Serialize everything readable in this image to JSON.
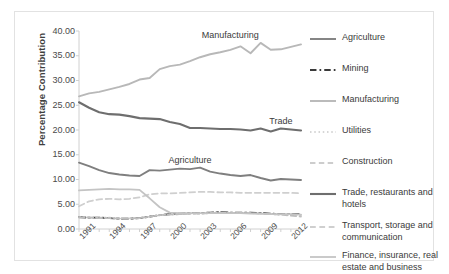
{
  "chart_data": {
    "type": "line",
    "title": "",
    "xlabel": "",
    "ylabel": "Percentage Contribution",
    "ylim": [
      0,
      40
    ],
    "yticks": [
      "0.00",
      "5.00",
      "10.00",
      "15.00",
      "20.00",
      "25.00",
      "30.00",
      "35.00",
      "40.00"
    ],
    "ytick_values": [
      0,
      5,
      10,
      15,
      20,
      25,
      30,
      35,
      40
    ],
    "grid": false,
    "legend_position": "right",
    "x": [
      1991,
      1992,
      1993,
      1994,
      1995,
      1996,
      1997,
      1998,
      1999,
      2000,
      2001,
      2002,
      2003,
      2004,
      2005,
      2006,
      2007,
      2008,
      2009,
      2010,
      2011,
      2012,
      2013
    ],
    "xticks": [
      "1991",
      "1994",
      "1997",
      "2000",
      "2003",
      "2006",
      "2009",
      "2012"
    ],
    "xtick_values": [
      1991,
      1994,
      1997,
      2000,
      2003,
      2006,
      2009,
      2012
    ],
    "annotations": [
      {
        "text": "Manufacturing",
        "x": 2006,
        "y": 39.0
      },
      {
        "text": "Agriculture",
        "x": 2002,
        "y": 13.8
      },
      {
        "text": "Trade",
        "x": 2011,
        "y": 21.6
      }
    ],
    "series": [
      {
        "name": "Agriculture",
        "color": "#7f7f7f",
        "style": "solid",
        "width": 1.9,
        "values": [
          13.4,
          12.7,
          11.9,
          11.3,
          11.0,
          10.8,
          10.7,
          11.9,
          11.8,
          12.0,
          12.2,
          12.1,
          12.4,
          11.6,
          11.2,
          10.9,
          10.7,
          10.9,
          10.3,
          9.8,
          10.1,
          10.0,
          9.9
        ]
      },
      {
        "name": "Mining",
        "color": "#3a3a3a",
        "style": "dashdot",
        "width": 1.9,
        "values": [
          2.4,
          2.3,
          2.3,
          2.2,
          2.1,
          2.1,
          2.2,
          2.5,
          2.8,
          3.0,
          3.1,
          3.2,
          3.2,
          3.3,
          3.4,
          3.3,
          3.3,
          3.3,
          3.2,
          3.1,
          3.0,
          3.0,
          3.0
        ]
      },
      {
        "name": "Manufacturing",
        "color": "#b8b8b8",
        "style": "solid",
        "width": 1.9,
        "values": [
          26.8,
          27.4,
          27.7,
          28.2,
          28.7,
          29.3,
          30.2,
          30.5,
          32.3,
          32.9,
          33.2,
          33.9,
          34.7,
          35.3,
          35.7,
          36.2,
          36.9,
          35.5,
          37.6,
          36.2,
          36.3,
          36.8,
          37.3
        ]
      },
      {
        "name": "Utilities",
        "color": "#c9c9c9",
        "style": "dotted",
        "width": 1.7,
        "values": [
          2.4,
          2.4,
          2.3,
          2.3,
          2.2,
          2.2,
          2.2,
          2.5,
          2.8,
          2.9,
          3.0,
          3.1,
          3.1,
          3.2,
          3.2,
          3.2,
          3.2,
          3.2,
          3.1,
          3.0,
          2.9,
          2.9,
          2.8
        ]
      },
      {
        "name": "Construction",
        "color": "#bdbdbd",
        "style": "dashed",
        "width": 1.7,
        "values": [
          2.3,
          2.3,
          2.2,
          2.2,
          2.1,
          2.1,
          2.2,
          2.5,
          2.8,
          2.9,
          3.0,
          3.1,
          3.1,
          3.2,
          3.3,
          3.2,
          3.2,
          3.2,
          3.1,
          3.0,
          2.9,
          2.7,
          2.5
        ]
      },
      {
        "name": "Trade, restaurants and hotels",
        "color": "#6e6e6e",
        "style": "solid",
        "width": 2.1,
        "values": [
          25.6,
          24.5,
          23.6,
          23.2,
          23.1,
          22.8,
          22.4,
          22.3,
          22.2,
          21.6,
          21.2,
          20.4,
          20.4,
          20.3,
          20.2,
          20.2,
          20.1,
          19.9,
          20.3,
          19.7,
          20.3,
          20.1,
          19.9
        ]
      },
      {
        "name": "Transport, storage and communication",
        "color": "#cfcfcf",
        "style": "dashed",
        "width": 1.8,
        "values": [
          4.6,
          5.6,
          6.0,
          6.1,
          6.0,
          6.1,
          6.4,
          7.0,
          7.2,
          7.2,
          7.3,
          7.4,
          7.5,
          7.5,
          7.4,
          7.4,
          7.3,
          7.3,
          7.3,
          7.3,
          7.3,
          7.3,
          7.2
        ]
      },
      {
        "name": "Finance, insurance, real estate and business services",
        "color": "#c4c4c4",
        "style": "solid",
        "width": 1.8,
        "values": [
          7.8,
          7.9,
          8.0,
          8.1,
          8.0,
          8.0,
          7.9,
          6.2,
          4.4,
          3.3,
          3.2,
          3.2,
          3.2,
          3.2,
          3.2,
          3.2,
          3.2,
          3.1,
          3.1,
          3.0,
          3.0,
          3.0,
          2.9
        ]
      }
    ]
  },
  "legend": {
    "items": [
      {
        "label": "Agriculture"
      },
      {
        "label": "Mining"
      },
      {
        "label": "Manufacturing"
      },
      {
        "label": "Utilities"
      },
      {
        "label": "Construction"
      },
      {
        "label": "Trade, restaurants and hotels"
      },
      {
        "label": "Transport, storage and communication"
      },
      {
        "label": "Finance, insurance, real estate and business services"
      }
    ]
  }
}
